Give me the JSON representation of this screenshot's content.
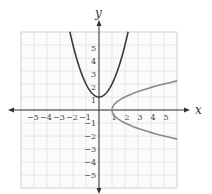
{
  "chart_data": {
    "type": "line",
    "title": "",
    "xlabel": "x",
    "ylabel": "y",
    "xlim": [
      -6,
      6
    ],
    "ylim": [
      -6,
      6
    ],
    "grid": true,
    "x_ticks": [
      -5,
      -4,
      -3,
      -2,
      -1,
      1,
      2,
      3,
      4,
      5
    ],
    "y_ticks": [
      -5,
      -4,
      -3,
      -2,
      -1,
      1,
      2,
      3,
      4,
      5
    ],
    "x_tick_labels": [
      "−5",
      "−4",
      "−3",
      "−2",
      "−1",
      "1",
      "2",
      "3",
      "4",
      "5"
    ],
    "y_tick_labels": [
      "−5",
      "−4",
      "−3",
      "−2",
      "−1",
      "1",
      "2",
      "3",
      "4",
      "5"
    ],
    "series": [
      {
        "name": "y = x^2 + 1",
        "color": "#3a3a3a",
        "x": [
          -2.24,
          -2,
          -1.5,
          -1,
          -0.5,
          0,
          0.5,
          1,
          1.5,
          2,
          2.24
        ],
        "y": [
          6.0,
          5,
          3.25,
          2,
          1.25,
          1,
          1.25,
          2,
          3.25,
          5,
          6.0
        ]
      },
      {
        "name": "x = y^2 + 1",
        "color": "#8a8a8a",
        "x": [
          6.0,
          5,
          3.25,
          2,
          1.25,
          1,
          1.25,
          2,
          3.25,
          5,
          6.0
        ],
        "y": [
          2.24,
          2,
          1.5,
          1,
          0.5,
          0,
          -0.5,
          -1,
          -1.5,
          -2,
          -2.24
        ]
      }
    ],
    "legend": null
  },
  "axes": {
    "x_label": "x",
    "y_label": "y"
  }
}
